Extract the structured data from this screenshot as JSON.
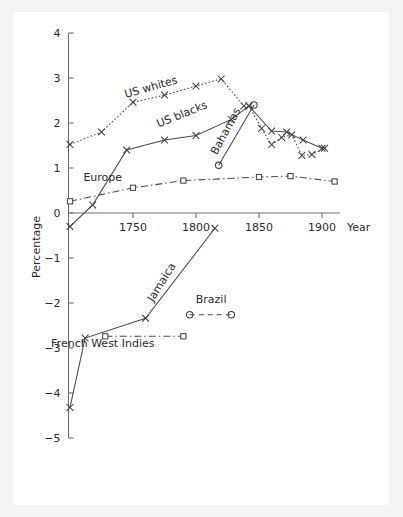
{
  "figure": {
    "background_color": "#f4f4f4",
    "plate_color": "#ffffff",
    "axis_color": "#6e6e6e",
    "ink_color": "#3d3d3d"
  },
  "labels": {
    "y_axis_title": "Percentage",
    "x_axis_title": "Year",
    "us_whites": "US whites",
    "us_blacks": "US blacks",
    "bahamas": "Bahamas",
    "europe": "Europe",
    "jamaica": "Jamaica",
    "brazil": "Brazil",
    "french_west_indies": "French West Indies"
  },
  "chart_data": {
    "type": "line",
    "title": "",
    "xlabel": "Year",
    "ylabel": "Percentage",
    "xlim": [
      1690,
      1925
    ],
    "ylim": [
      -5,
      4
    ],
    "xticks": [
      1750,
      1800,
      1850,
      1900
    ],
    "xticklabels": [
      "1750",
      "1800",
      "1850",
      "1900"
    ],
    "yticks": [
      -5,
      -4,
      -3,
      -2,
      -1,
      0,
      1,
      2,
      3,
      4
    ],
    "yticklabels": [
      "-5",
      "-4",
      "-3",
      "-2",
      "-1",
      "0",
      "1",
      "2",
      "3",
      "4"
    ],
    "grid": false,
    "legend": "inline-annotations",
    "series": [
      {
        "name": "US whites",
        "marker": "x",
        "linestyle": "dotted",
        "label_x": 1765,
        "label_y": 2.72,
        "label_rotation": -16,
        "points": [
          {
            "x": 1700,
            "y": 1.52
          },
          {
            "x": 1725,
            "y": 1.8
          },
          {
            "x": 1750,
            "y": 2.46
          },
          {
            "x": 1775,
            "y": 2.62
          },
          {
            "x": 1800,
            "y": 2.82
          },
          {
            "x": 1820,
            "y": 2.98
          },
          {
            "x": 1838,
            "y": 2.38
          }
        ]
      },
      {
        "name": "US blacks",
        "marker": "x",
        "linestyle": "solid",
        "label_x": 1790,
        "label_y": 2.12,
        "label_rotation": -22,
        "points": [
          {
            "x": 1700,
            "y": -0.3
          },
          {
            "x": 1718,
            "y": 0.18
          },
          {
            "x": 1745,
            "y": 1.4
          },
          {
            "x": 1775,
            "y": 1.62
          },
          {
            "x": 1800,
            "y": 1.72
          },
          {
            "x": 1828,
            "y": 2.08
          },
          {
            "x": 1842,
            "y": 2.38
          },
          {
            "x": 1860,
            "y": 1.82
          },
          {
            "x": 1872,
            "y": 1.8
          },
          {
            "x": 1885,
            "y": 1.62
          },
          {
            "x": 1900,
            "y": 1.44
          }
        ]
      },
      {
        "name": "Bahamas",
        "marker": "o",
        "linestyle": "solid",
        "label_x": 1826,
        "label_y": 1.78,
        "label_rotation": -62,
        "points": [
          {
            "x": 1818,
            "y": 1.06
          },
          {
            "x": 1846,
            "y": 2.4
          }
        ]
      },
      {
        "name": "Europe",
        "marker": "square",
        "linestyle": "dashdot",
        "label_x": 1726,
        "label_y": 0.72,
        "label_rotation": 0,
        "points": [
          {
            "x": 1700,
            "y": 0.26
          },
          {
            "x": 1750,
            "y": 0.56
          },
          {
            "x": 1790,
            "y": 0.72
          },
          {
            "x": 1850,
            "y": 0.8
          },
          {
            "x": 1875,
            "y": 0.82
          },
          {
            "x": 1910,
            "y": 0.7
          }
        ]
      },
      {
        "name": "US blacks secondary",
        "marker": "x",
        "linestyle": "dotted",
        "points": [
          {
            "x": 1842,
            "y": 2.38
          },
          {
            "x": 1852,
            "y": 1.88
          },
          {
            "x": 1860,
            "y": 1.52
          },
          {
            "x": 1868,
            "y": 1.68
          },
          {
            "x": 1876,
            "y": 1.74
          },
          {
            "x": 1884,
            "y": 1.28
          },
          {
            "x": 1892,
            "y": 1.3
          },
          {
            "x": 1902,
            "y": 1.44
          }
        ]
      },
      {
        "name": "Jamaica",
        "marker": "x",
        "linestyle": "solid",
        "label_x": 1775,
        "label_y": -1.58,
        "label_rotation": -58,
        "points": [
          {
            "x": 1700,
            "y": -4.32
          },
          {
            "x": 1712,
            "y": -2.78
          },
          {
            "x": 1760,
            "y": -2.34
          },
          {
            "x": 1815,
            "y": -0.34
          }
        ]
      },
      {
        "name": "Brazil",
        "marker": "o",
        "linestyle": "dashed",
        "label_x": 1812,
        "label_y": -2.0,
        "label_rotation": 0,
        "points": [
          {
            "x": 1795,
            "y": -2.26
          },
          {
            "x": 1828,
            "y": -2.26
          }
        ]
      },
      {
        "name": "French West Indies",
        "marker": "square",
        "linestyle": "dashdot",
        "label_x": 1726,
        "label_y": -2.98,
        "label_rotation": 0,
        "points": [
          {
            "x": 1728,
            "y": -2.74
          },
          {
            "x": 1790,
            "y": -2.74
          }
        ]
      }
    ]
  }
}
